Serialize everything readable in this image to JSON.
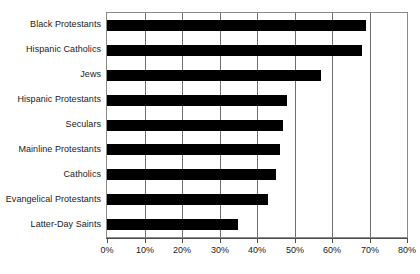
{
  "chart_data": {
    "type": "bar",
    "orientation": "horizontal",
    "title": "",
    "xlabel": "",
    "ylabel": "",
    "xlim": [
      0,
      80
    ],
    "xtick_labels": [
      "0%",
      "10%",
      "20%",
      "30%",
      "40%",
      "50%",
      "60%",
      "70%",
      "80%"
    ],
    "xtick_values": [
      0,
      10,
      20,
      30,
      40,
      50,
      60,
      70,
      80
    ],
    "grid": "vertical",
    "legend": "none",
    "bar_color": "#000000",
    "categories": [
      "Black Protestants",
      "Hispanic Catholics",
      "Jews",
      "Hispanic Protestants",
      "Seculars",
      "Mainline Protestants",
      "Catholics",
      "Evangelical Protestants",
      "Latter-Day Saints"
    ],
    "values": [
      69,
      68,
      57,
      48,
      47,
      46,
      45,
      43,
      35
    ],
    "value_labels": [
      "69%",
      "68%",
      "57%",
      "48%",
      "47%",
      "46%",
      "45%",
      "43%",
      "35%"
    ]
  }
}
